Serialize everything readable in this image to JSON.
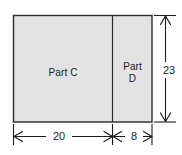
{
  "figure": {
    "fill_color": "#e3e3e3",
    "line_color": "#1c1c1c",
    "background_color": "#ffffff",
    "regions": [
      {
        "id": "part-c",
        "label": "Part C",
        "width": "20",
        "height": "23"
      },
      {
        "id": "part-d",
        "label_line1": "Part",
        "label_line2": "D",
        "label": "Part D",
        "width": "8",
        "height": "23"
      }
    ],
    "dimensions": [
      {
        "id": "width-part-c",
        "value": "20",
        "orientation": "horizontal",
        "position": "bottom-left"
      },
      {
        "id": "width-part-d",
        "value": "8",
        "orientation": "horizontal",
        "position": "bottom-right"
      },
      {
        "id": "total-height",
        "value": "23",
        "orientation": "vertical",
        "position": "right"
      }
    ]
  },
  "labels": {
    "part_c": "Part C",
    "part_d_line1": "Part",
    "part_d_line2": "D",
    "dim_20": "20",
    "dim_8": "8",
    "dim_23": "23"
  }
}
